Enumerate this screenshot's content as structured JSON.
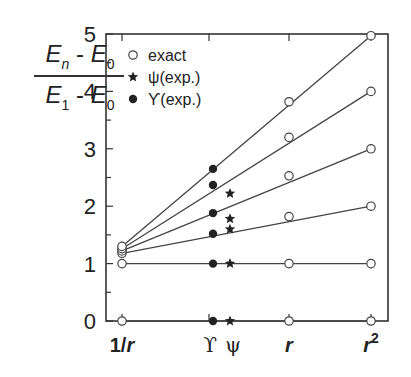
{
  "chart_data": {
    "type": "scatter",
    "title": "",
    "ylabel": "(E_n - E_0)/(E_1 - E_0)",
    "ylabel_parts": {
      "num_a": "E",
      "num_a_sub": "n",
      "num_b": "E",
      "num_b_sub": "0",
      "den_a": "E",
      "den_a_sub": "1",
      "den_b": "E",
      "den_b_sub": "0",
      "minus": "-"
    },
    "xlabel": "",
    "ylim": [
      0,
      5
    ],
    "yticks": [
      0,
      1,
      2,
      3,
      4,
      5
    ],
    "x_categories": [
      {
        "label": "1/r",
        "pos": 0
      },
      {
        "label": "ϒ",
        "pos": 1.1
      },
      {
        "label": "ψ",
        "pos": 1.3
      },
      {
        "label": "r",
        "pos": 2
      },
      {
        "label": "r²",
        "pos": 3
      }
    ],
    "xlim": [
      -0.2,
      3.2
    ],
    "grid": false,
    "legend": {
      "position": "upper-left",
      "entries": [
        {
          "marker": "open-circle",
          "label": "exact"
        },
        {
          "marker": "star",
          "label": "ψ(exp.)"
        },
        {
          "marker": "filled-circle",
          "label": "ϒ(exp.)"
        }
      ]
    },
    "series": [
      {
        "name": "exact",
        "marker": "open-circle",
        "points": [
          {
            "x": "1/r",
            "y": 0
          },
          {
            "x": "1/r",
            "y": 1.0
          },
          {
            "x": "1/r",
            "y": 1.18
          },
          {
            "x": "1/r",
            "y": 1.22
          },
          {
            "x": "1/r",
            "y": 1.26
          },
          {
            "x": "1/r",
            "y": 1.3
          },
          {
            "x": "r",
            "y": 0
          },
          {
            "x": "r",
            "y": 1.0
          },
          {
            "x": "r",
            "y": 1.82
          },
          {
            "x": "r",
            "y": 2.53
          },
          {
            "x": "r",
            "y": 3.2
          },
          {
            "x": "r",
            "y": 3.82
          },
          {
            "x": "r²",
            "y": 0
          },
          {
            "x": "r²",
            "y": 1.0
          },
          {
            "x": "r²",
            "y": 2.0
          },
          {
            "x": "r²",
            "y": 3.0
          },
          {
            "x": "r²",
            "y": 4.0
          },
          {
            "x": "r²",
            "y": 4.97
          }
        ]
      },
      {
        "name": "ψ(exp.)",
        "marker": "star",
        "points": [
          {
            "x": "ψ",
            "y": 0
          },
          {
            "x": "ψ",
            "y": 1.0
          },
          {
            "x": "ψ",
            "y": 1.6
          },
          {
            "x": "ψ",
            "y": 1.78
          },
          {
            "x": "ψ",
            "y": 2.22
          }
        ]
      },
      {
        "name": "ϒ(exp.)",
        "marker": "filled-circle",
        "points": [
          {
            "x": "ϒ",
            "y": 0
          },
          {
            "x": "ϒ",
            "y": 1.0
          },
          {
            "x": "ϒ",
            "y": 1.52
          },
          {
            "x": "ϒ",
            "y": 1.88
          },
          {
            "x": "ϒ",
            "y": 2.37
          },
          {
            "x": "ϒ",
            "y": 2.65
          }
        ]
      }
    ],
    "lines": [
      {
        "name": "level-0",
        "from": {
          "x": "1/r",
          "y": 0
        },
        "to": {
          "x": "r²",
          "y": 0
        }
      },
      {
        "name": "level-1",
        "from": {
          "x": "1/r",
          "y": 1.0
        },
        "to": {
          "x": "r²",
          "y": 1.0
        }
      },
      {
        "name": "level-2",
        "from": {
          "x": "1/r",
          "y": 1.18
        },
        "to": {
          "x": "r²",
          "y": 2.0
        }
      },
      {
        "name": "level-3",
        "from": {
          "x": "1/r",
          "y": 1.22
        },
        "to": {
          "x": "r²",
          "y": 3.0
        }
      },
      {
        "name": "level-4",
        "from": {
          "x": "1/r",
          "y": 1.26
        },
        "to": {
          "x": "r²",
          "y": 4.0
        }
      },
      {
        "name": "level-5",
        "from": {
          "x": "1/r",
          "y": 1.3
        },
        "to": {
          "x": "r²",
          "y": 4.97
        }
      }
    ]
  }
}
